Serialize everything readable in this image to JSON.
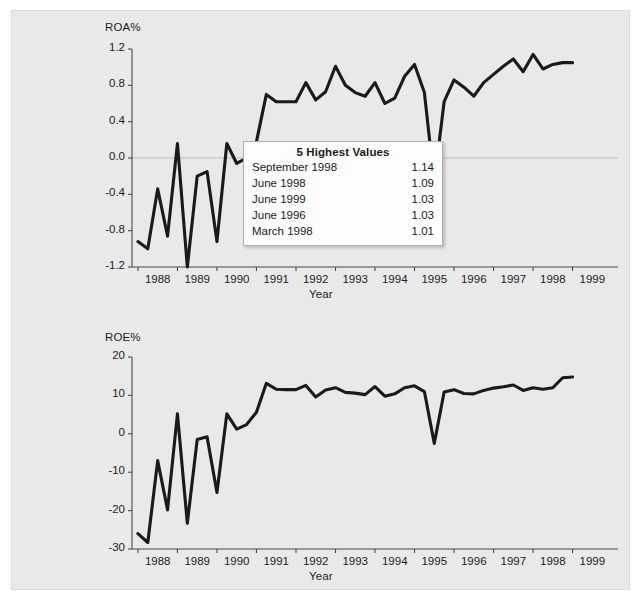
{
  "chart_data": [
    {
      "type": "line",
      "id": "roa",
      "title": "",
      "ylabel": "ROA%",
      "xlabel": "Year",
      "ylim": [
        -1.2,
        1.2
      ],
      "yticks": [
        "1.2",
        "0.8",
        "0.4",
        "0.0",
        "-0.4",
        "-0.8",
        "-1.2"
      ],
      "ytick_values": [
        1.2,
        0.8,
        0.4,
        0.0,
        -0.4,
        -0.8,
        -1.2
      ],
      "xticks": [
        "1988",
        "1989",
        "1990",
        "1991",
        "1992",
        "1993",
        "1994",
        "1995",
        "1996",
        "1997",
        "1998",
        "1999"
      ],
      "xlim": [
        1987.6,
        1999.9
      ],
      "grid": "zero-line-only",
      "legend": "none",
      "x": [
        1987.75,
        1988.0,
        1988.25,
        1988.5,
        1988.75,
        1989.0,
        1989.25,
        1989.5,
        1989.75,
        1990.0,
        1990.25,
        1990.5,
        1990.75,
        1991.0,
        1991.25,
        1991.5,
        1991.75,
        1992.0,
        1992.25,
        1992.5,
        1992.75,
        1993.0,
        1993.25,
        1993.5,
        1993.75,
        1994.0,
        1994.25,
        1994.5,
        1994.75,
        1995.0,
        1995.25,
        1995.5,
        1995.75,
        1996.0,
        1996.25,
        1996.5,
        1996.75,
        1997.0,
        1997.25,
        1997.5,
        1997.75,
        1998.0,
        1998.25,
        1998.5,
        1998.75,
        1999.0,
        1999.25,
        1999.5,
        1999.75
      ],
      "values": [
        -0.92,
        -1.0,
        -0.34,
        -0.86,
        0.16,
        -1.2,
        -0.2,
        -0.15,
        -0.92,
        0.16,
        -0.06,
        0.0,
        0.18,
        0.7,
        0.62,
        0.62,
        0.62,
        0.83,
        0.64,
        0.73,
        1.01,
        0.8,
        0.72,
        0.68,
        0.83,
        0.6,
        0.66,
        0.9,
        1.03,
        0.72,
        -0.27,
        0.62,
        0.86,
        0.78,
        0.68,
        0.83,
        0.92,
        1.01,
        1.09,
        0.95,
        1.14,
        0.98,
        1.03,
        1.05,
        1.05
      ],
      "highest_values": {
        "title": "5 Highest Values",
        "rows": [
          {
            "label": "September 1998",
            "value": "1.14"
          },
          {
            "label": "June 1998",
            "value": "1.09"
          },
          {
            "label": "June 1999",
            "value": "1.03"
          },
          {
            "label": "June 1996",
            "value": "1.03"
          },
          {
            "label": "March 1998",
            "value": "1.01"
          }
        ]
      }
    },
    {
      "type": "line",
      "id": "roe",
      "title": "",
      "ylabel": "ROE%",
      "xlabel": "Year",
      "ylim": [
        -30,
        20
      ],
      "yticks": [
        "20",
        "10",
        "0",
        "-10",
        "-20",
        "-30"
      ],
      "ytick_values": [
        20,
        10,
        0,
        -10,
        -20,
        -30
      ],
      "xticks": [
        "1988",
        "1989",
        "1990",
        "1991",
        "1992",
        "1993",
        "1994",
        "1995",
        "1996",
        "1997",
        "1998",
        "1999"
      ],
      "xlim": [
        1987.6,
        1999.9
      ],
      "grid": "none",
      "legend": "none",
      "x": [
        1987.75,
        1988.0,
        1988.25,
        1988.5,
        1988.75,
        1989.0,
        1989.25,
        1989.5,
        1989.75,
        1990.0,
        1990.25,
        1990.5,
        1990.75,
        1991.0,
        1991.25,
        1991.5,
        1991.75,
        1992.0,
        1992.25,
        1992.5,
        1992.75,
        1993.0,
        1993.25,
        1993.5,
        1993.75,
        1994.0,
        1994.25,
        1994.5,
        1994.75,
        1995.0,
        1995.25,
        1995.5,
        1995.75,
        1996.0,
        1996.25,
        1996.5,
        1996.75,
        1997.0,
        1997.25,
        1997.5,
        1997.75,
        1998.0,
        1998.25,
        1998.5,
        1998.75,
        1999.0,
        1999.25,
        1999.5,
        1999.75
      ],
      "values": [
        -26.0,
        -28.3,
        -7.0,
        -19.8,
        5.2,
        -23.3,
        -1.5,
        -0.8,
        -15.3,
        5.2,
        1.2,
        2.4,
        5.6,
        13.14,
        11.6,
        11.5,
        11.5,
        12.6,
        9.6,
        11.4,
        12.0,
        10.8,
        10.6,
        10.2,
        12.31,
        9.8,
        10.4,
        12.0,
        12.5,
        11.0,
        -2.5,
        10.9,
        11.5,
        10.5,
        10.4,
        11.3,
        11.9,
        12.26,
        12.71,
        11.3,
        12.0,
        11.6,
        11.99,
        14.6,
        14.8
      ],
      "highest_values": {
        "title": "5 Highest Values",
        "rows": [
          {
            "label": "March 1993",
            "value": "13.14"
          },
          {
            "label": "September 1998",
            "value": "12.71"
          },
          {
            "label": "June 1996",
            "value": "12.31"
          },
          {
            "label": "June 1998",
            "value": "12.26"
          },
          {
            "label": "June 1999",
            "value": "11.99"
          }
        ]
      }
    }
  ],
  "colors": {
    "background": "#e9e9e9",
    "line": "#1a1a1a",
    "axis": "#4a4a4a",
    "text": "#1c1c1c",
    "box_background": "#fdfdfd",
    "box_border": "#b0b0b0"
  }
}
